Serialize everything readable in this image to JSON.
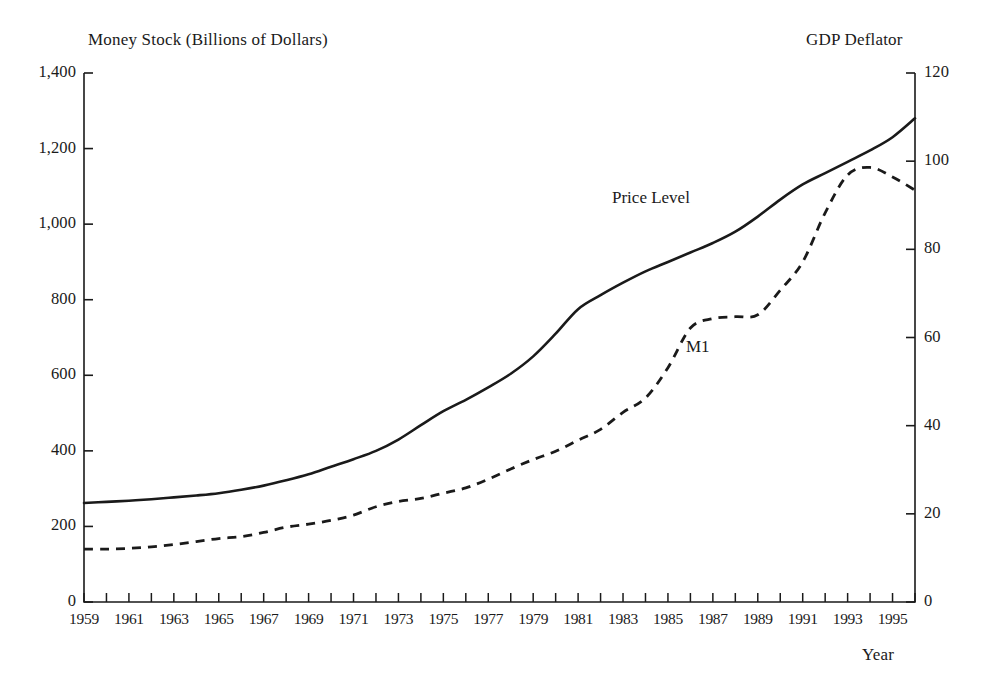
{
  "chart_data": {
    "type": "line",
    "title": "",
    "xlabel": "Year",
    "ylabel": "Money Stock (Billions of Dollars)",
    "y2label": "GDP Deflator",
    "grid": false,
    "legend_position": "inline-annotation",
    "xlim": [
      1959,
      1996
    ],
    "ylim": [
      0,
      1400
    ],
    "y2lim": [
      0,
      120
    ],
    "yticks": [
      "0",
      "200",
      "400",
      "600",
      "800",
      "1,000",
      "1,200",
      "1,400"
    ],
    "ytick_values": [
      0,
      200,
      400,
      600,
      800,
      1000,
      1200,
      1400
    ],
    "y2ticks": [
      "0",
      "20",
      "40",
      "60",
      "80",
      "100",
      "120"
    ],
    "y2tick_values": [
      0,
      20,
      40,
      60,
      80,
      100,
      120
    ],
    "xticks": [
      "1959",
      "1961",
      "1963",
      "1965",
      "1967",
      "1969",
      "1971",
      "1973",
      "1975",
      "1977",
      "1979",
      "1981",
      "1983",
      "1985",
      "1987",
      "1989",
      "1991",
      "1993",
      "1995"
    ],
    "xtick_values": [
      1959,
      1961,
      1963,
      1965,
      1967,
      1969,
      1971,
      1973,
      1975,
      1977,
      1979,
      1981,
      1983,
      1985,
      1987,
      1989,
      1991,
      1993,
      1995
    ],
    "x": [
      1959,
      1960,
      1961,
      1962,
      1963,
      1964,
      1965,
      1966,
      1967,
      1968,
      1969,
      1970,
      1971,
      1972,
      1973,
      1974,
      1975,
      1976,
      1977,
      1978,
      1979,
      1980,
      1981,
      1982,
      1983,
      1984,
      1985,
      1986,
      1987,
      1988,
      1989,
      1990,
      1991,
      1992,
      1993,
      1994,
      1995,
      1996
    ],
    "series": [
      {
        "name": "M1",
        "axis": "left",
        "style": "dashed",
        "color": "#1a1a1a",
        "label_text": "M1",
        "values": [
          140,
          140,
          142,
          146,
          152,
          160,
          168,
          173,
          184,
          198,
          206,
          216,
          230,
          252,
          266,
          274,
          288,
          302,
          325,
          352,
          377,
          399,
          428,
          457,
          502,
          540,
          620,
          725,
          750,
          755,
          760,
          825,
          900,
          1030,
          1130,
          1150,
          1125,
          1090
        ]
      },
      {
        "name": "Price Level",
        "axis": "right",
        "style": "solid",
        "color": "#1a1a1a",
        "label_text": "Price Level",
        "values_left_scale": [
          262,
          265,
          268,
          272,
          277,
          282,
          288,
          297,
          308,
          322,
          338,
          358,
          378,
          400,
          430,
          468,
          505,
          535,
          568,
          604,
          650,
          710,
          775,
          812,
          845,
          875,
          900,
          925,
          950,
          980,
          1020,
          1065,
          1105,
          1135,
          1165,
          1195,
          1230,
          1280
        ],
        "values": [
          22.5,
          22.7,
          23.0,
          23.3,
          23.7,
          24.2,
          24.7,
          25.5,
          26.4,
          27.6,
          29.0,
          30.7,
          32.4,
          34.3,
          36.9,
          40.1,
          43.3,
          45.9,
          48.7,
          51.8,
          55.7,
          60.9,
          66.4,
          69.6,
          72.4,
          75.0,
          77.1,
          79.3,
          81.4,
          84.0,
          87.4,
          91.3,
          94.7,
          97.3,
          99.9,
          102.4,
          105.4,
          109.7
        ]
      }
    ]
  },
  "annotations": {
    "price_level_label": "Price Level",
    "m1_label": "M1"
  },
  "axes": {
    "left_title": "Money Stock (Billions of Dollars)",
    "right_title": "GDP Deflator",
    "x_title": "Year"
  },
  "colors": {
    "ink": "#1a1a1a",
    "background": "#ffffff"
  }
}
